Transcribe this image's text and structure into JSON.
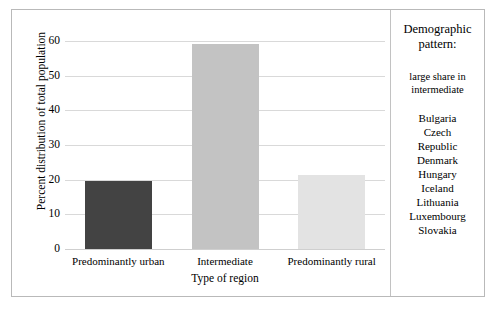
{
  "chart_data": {
    "type": "bar",
    "title": "",
    "xlabel": "Type of region",
    "ylabel": "Percent distribution of total population",
    "categories": [
      "Predominantly urban",
      "Intermediate",
      "Predominantly rural"
    ],
    "values": [
      19.7,
      59.0,
      21.3
    ],
    "series": [
      {
        "name": "Percent distribution of total population",
        "values": [
          19.7,
          59.0,
          21.3
        ]
      }
    ],
    "ylim": [
      0,
      60
    ],
    "yticks": [
      60,
      50,
      40,
      30,
      20,
      10,
      0
    ],
    "ytick_labels": [
      "60",
      "50",
      "40",
      "30",
      "20",
      "10",
      "0"
    ],
    "grid": true,
    "legend": false,
    "bar_colors": [
      "#434343",
      "#c3c3c3",
      "#e3e3e3"
    ]
  },
  "side_panel": {
    "heading": "Demographic pattern:",
    "subtitle": "large share in intermediate",
    "countries": [
      "Bulgaria",
      "Czech",
      "Republic",
      "Denmark",
      "Hungary",
      "Iceland",
      "Lithuania",
      "Luxembourg",
      "Slovakia"
    ]
  },
  "colors": {
    "frame_border": "#b9b9b9",
    "gridline": "#d9d9d9",
    "divider": "#c2c2c2",
    "text": "#000000",
    "background": "#ffffff"
  }
}
